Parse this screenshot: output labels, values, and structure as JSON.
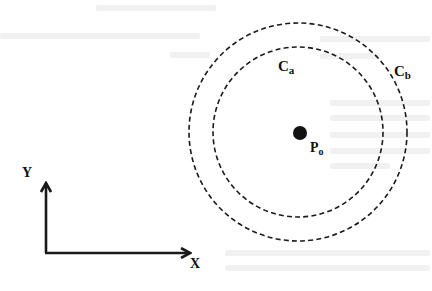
{
  "diagram": {
    "type": "concentric-circles-with-axes",
    "colors": {
      "stroke": "#1a1a1a",
      "background": "#ffffff",
      "ghost_text": "#f1f1f1"
    },
    "center_point": {
      "label_main": "P",
      "label_sub": "o",
      "x": 299,
      "y": 133
    },
    "circles": [
      {
        "id": "Ca",
        "label_main": "C",
        "label_sub": "a",
        "radius": 85,
        "style": "dashed"
      },
      {
        "id": "Cb",
        "label_main": "C",
        "label_sub": "b",
        "radius": 109,
        "style": "dashed"
      }
    ],
    "axes": {
      "origin": {
        "x": 46,
        "y": 253
      },
      "y_axis": {
        "label": "Y",
        "end": {
          "x": 46,
          "y": 182
        }
      },
      "x_axis": {
        "label": "X",
        "end": {
          "x": 191,
          "y": 253
        }
      }
    }
  }
}
